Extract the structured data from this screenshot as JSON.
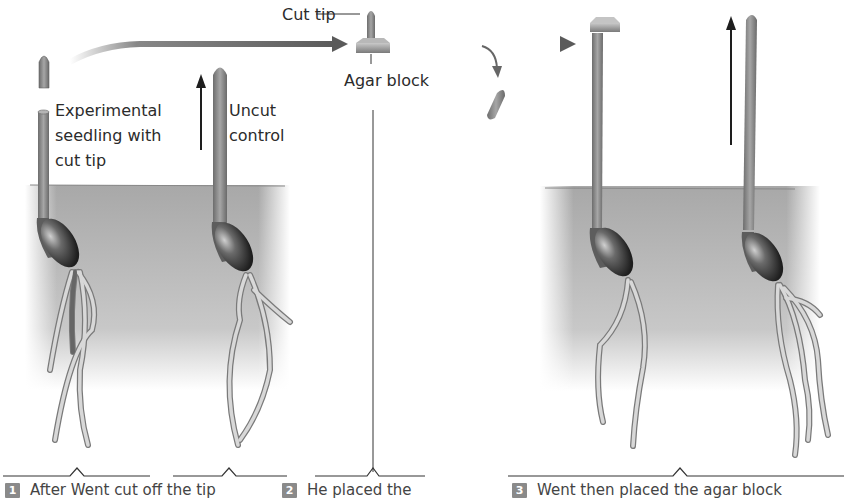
{
  "figure": {
    "panels": [
      {
        "id": 1,
        "labels": {
          "experimental": "Experimental\nseedling with\ncut tip",
          "control": "Uncut\ncontrol"
        },
        "caption": {
          "step": "1",
          "text": "After Went cut off the tip"
        }
      },
      {
        "id": 2,
        "labels": {
          "cut_tip": "Cut tip",
          "agar_block": "Agar block"
        },
        "caption": {
          "step": "2",
          "text": "He placed the"
        }
      },
      {
        "id": 3,
        "caption": {
          "step": "3",
          "text": "Went then placed the agar block"
        }
      }
    ],
    "colors": {
      "soil": "#b9b9b9",
      "stem": "#8c8c8c",
      "seed": "#4a4a4a",
      "root": "#cfcfcf",
      "arrow": "#666666",
      "growth_arrow": "#1e1e1e",
      "line": "#333333"
    }
  }
}
